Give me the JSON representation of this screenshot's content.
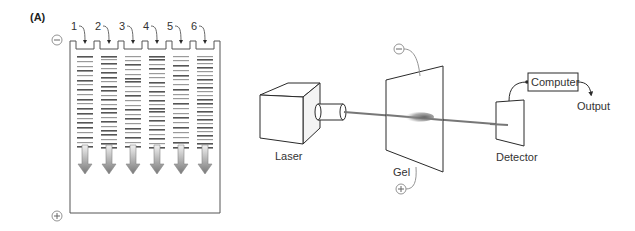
{
  "figure": {
    "panel_label": "(A)",
    "gel_slab": {
      "negative_symbol": "−",
      "positive_symbol": "+",
      "lanes": [
        {
          "number": "1",
          "bands": [
            [
              0,
              "d"
            ],
            [
              5,
              "l"
            ],
            [
              10,
              "l"
            ],
            [
              14,
              "d"
            ],
            [
              19,
              "l"
            ],
            [
              24,
              "d"
            ],
            [
              28,
              "l"
            ],
            [
              33,
              "d"
            ],
            [
              38,
              "l"
            ],
            [
              43,
              "d"
            ],
            [
              47,
              "l"
            ],
            [
              52,
              "d"
            ],
            [
              57,
              "d"
            ],
            [
              62,
              "l"
            ],
            [
              66,
              "d"
            ],
            [
              71,
              "d"
            ],
            [
              76,
              "l"
            ],
            [
              81,
              "d"
            ],
            [
              86,
              "l"
            ],
            [
              90,
              "d"
            ]
          ]
        },
        {
          "number": "2",
          "bands": [
            [
              0,
              "d"
            ],
            [
              3,
              "l"
            ],
            [
              7,
              "d"
            ],
            [
              12,
              "l"
            ],
            [
              16,
              "d"
            ],
            [
              21,
              "d"
            ],
            [
              25,
              "l"
            ],
            [
              30,
              "d"
            ],
            [
              34,
              "d"
            ],
            [
              39,
              "l"
            ],
            [
              43,
              "d"
            ],
            [
              48,
              "l"
            ],
            [
              52,
              "d"
            ],
            [
              56,
              "d"
            ],
            [
              61,
              "l"
            ],
            [
              65,
              "d"
            ],
            [
              70,
              "l"
            ],
            [
              74,
              "d"
            ],
            [
              78,
              "d"
            ],
            [
              83,
              "l"
            ],
            [
              87,
              "d"
            ],
            [
              91,
              "d"
            ]
          ]
        },
        {
          "number": "3",
          "bands": [
            [
              0,
              "l"
            ],
            [
              4,
              "l"
            ],
            [
              8,
              "d"
            ],
            [
              13,
              "l"
            ],
            [
              18,
              "l"
            ],
            [
              22,
              "d"
            ],
            [
              25,
              "d"
            ],
            [
              30,
              "l"
            ],
            [
              35,
              "l"
            ],
            [
              39,
              "d"
            ],
            [
              44,
              "l"
            ],
            [
              49,
              "l"
            ],
            [
              53,
              "d"
            ],
            [
              58,
              "l"
            ],
            [
              62,
              "d"
            ],
            [
              67,
              "l"
            ],
            [
              72,
              "d"
            ],
            [
              76,
              "l"
            ],
            [
              81,
              "d"
            ],
            [
              86,
              "l"
            ],
            [
              90,
              "d"
            ]
          ]
        },
        {
          "number": "4",
          "bands": [
            [
              0,
              "d"
            ],
            [
              3,
              "d"
            ],
            [
              8,
              "l"
            ],
            [
              12,
              "d"
            ],
            [
              17,
              "l"
            ],
            [
              21,
              "l"
            ],
            [
              26,
              "d"
            ],
            [
              30,
              "l"
            ],
            [
              35,
              "d"
            ],
            [
              39,
              "l"
            ],
            [
              44,
              "d"
            ],
            [
              48,
              "l"
            ],
            [
              52,
              "d"
            ],
            [
              55,
              "d"
            ],
            [
              60,
              "l"
            ],
            [
              64,
              "d"
            ],
            [
              69,
              "l"
            ],
            [
              73,
              "d"
            ],
            [
              78,
              "l"
            ],
            [
              82,
              "d"
            ],
            [
              87,
              "l"
            ],
            [
              91,
              "d"
            ]
          ]
        },
        {
          "number": "5",
          "bands": [
            [
              0,
              "l"
            ],
            [
              4,
              "l"
            ],
            [
              9,
              "d"
            ],
            [
              14,
              "l"
            ],
            [
              19,
              "d"
            ],
            [
              23,
              "l"
            ],
            [
              28,
              "l"
            ],
            [
              33,
              "d"
            ],
            [
              38,
              "l"
            ],
            [
              42,
              "l"
            ],
            [
              47,
              "d"
            ],
            [
              52,
              "l"
            ],
            [
              57,
              "l"
            ],
            [
              61,
              "d"
            ],
            [
              66,
              "l"
            ],
            [
              71,
              "d"
            ],
            [
              76,
              "l"
            ],
            [
              81,
              "l"
            ],
            [
              86,
              "d"
            ],
            [
              91,
              "d"
            ]
          ]
        },
        {
          "number": "6",
          "bands": [
            [
              0,
              "l"
            ],
            [
              3,
              "d"
            ],
            [
              7,
              "l"
            ],
            [
              11,
              "d"
            ],
            [
              15,
              "l"
            ],
            [
              19,
              "l"
            ],
            [
              23,
              "d"
            ],
            [
              27,
              "l"
            ],
            [
              31,
              "d"
            ],
            [
              35,
              "l"
            ],
            [
              39,
              "l"
            ],
            [
              43,
              "d"
            ],
            [
              47,
              "d"
            ],
            [
              51,
              "l"
            ],
            [
              55,
              "d"
            ],
            [
              59,
              "l"
            ],
            [
              63,
              "d"
            ],
            [
              67,
              "l"
            ],
            [
              71,
              "d"
            ],
            [
              75,
              "l"
            ],
            [
              79,
              "d"
            ],
            [
              83,
              "l"
            ],
            [
              87,
              "d"
            ],
            [
              91,
              "d"
            ]
          ]
        }
      ],
      "migration_direction": "down (− to +)"
    },
    "capillary_setup": {
      "laser_label": "Laser",
      "gel_label": "Gel",
      "gel_negative_symbol": "−",
      "gel_positive_symbol": "+",
      "detector_label": "Detector",
      "computer_label": "Computer",
      "output_label": "Output"
    },
    "colors": {
      "line": "#2a2a2a",
      "band_dark": "#555555",
      "band_light": "#9a9a9a",
      "beam": "#777777",
      "arrow_fill": "#8a8a8a",
      "symbol_circle": "#888888"
    }
  }
}
